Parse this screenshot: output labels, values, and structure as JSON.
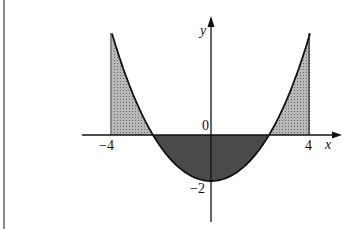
{
  "figure": {
    "axes": {
      "x_label": "x",
      "y_label": "y",
      "origin_label": "0"
    },
    "ticks": {
      "x_left": "−4",
      "x_right": "4",
      "y_min": "−2"
    },
    "colors": {
      "positive_fill": "#a8a8a8",
      "negative_fill": "#4a4a4a",
      "line": "#111111",
      "border": "#8a8a8a"
    }
  },
  "chart_data": {
    "type": "area",
    "title": "",
    "xlabel": "x",
    "ylabel": "y",
    "xlim": [
      -4,
      4
    ],
    "x": [
      -4,
      -3,
      -2.3,
      -2,
      -1,
      0,
      1,
      2,
      2.3,
      3,
      4
    ],
    "y": [
      4.42,
      1.39,
      0.0,
      -0.56,
      -1.65,
      -2.0,
      -1.65,
      -0.56,
      0.0,
      1.39,
      4.42
    ],
    "annotations": [
      "-4",
      "4",
      "0",
      "-2"
    ]
  }
}
